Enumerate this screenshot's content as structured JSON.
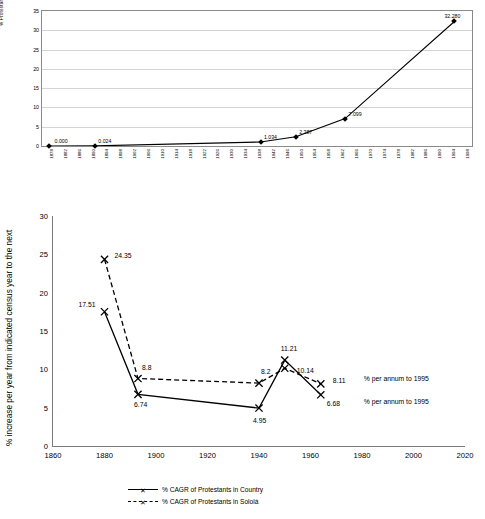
{
  "chart_data": [
    {
      "type": "line",
      "id": "protestant-percentage-by-year",
      "title": "",
      "xlabel": "",
      "ylabel": "% Protestant",
      "ylim": [
        0,
        35
      ],
      "yticks": [
        0,
        5,
        10,
        15,
        20,
        25,
        30,
        35
      ],
      "grid": true,
      "xticks": [
        "1878",
        "1882",
        "1886",
        "1890",
        "1894",
        "1898",
        "1902",
        "1906",
        "1910",
        "1914",
        "1918",
        "1922",
        "1926",
        "1930",
        "1934",
        "1938",
        "1942",
        "1946",
        "1950",
        "1954",
        "1958",
        "1962",
        "1966",
        "1970",
        "1974",
        "1978",
        "1982",
        "1986",
        "1990",
        "1994",
        "1998"
      ],
      "series": [
        {
          "name": "% Protestant",
          "points": [
            {
              "x": "1880",
              "y": 0.0,
              "label": "0.000"
            },
            {
              "x": "1893",
              "y": 0.024,
              "label": "0.024"
            },
            {
              "x": "1940",
              "y": 1.034,
              "label": "1.034"
            },
            {
              "x": "1950",
              "y": 2.387,
              "label": "2.387"
            },
            {
              "x": "1964",
              "y": 7.099,
              "label": "7.099"
            },
            {
              "x": "1995",
              "y": 32.28,
              "label": "32.280"
            }
          ]
        }
      ]
    },
    {
      "type": "line",
      "id": "cagr-protestants",
      "title": "",
      "xlabel": "",
      "ylabel": "% increase per year from indicated census year to the next",
      "ylim": [
        0,
        30
      ],
      "yticks": [
        0,
        5,
        10,
        15,
        20,
        25,
        30
      ],
      "xlim": [
        1860,
        2020
      ],
      "xticks": [
        1860,
        1880,
        1900,
        1920,
        1940,
        1960,
        1980,
        2000,
        2020
      ],
      "grid": false,
      "legend_position": "bottom",
      "series": [
        {
          "name": "% CAGR of Protestants in Country",
          "marker": "x",
          "style": "solid",
          "points": [
            {
              "x": 1880,
              "y": 17.51,
              "label": "17.51"
            },
            {
              "x": 1893,
              "y": 6.74,
              "label": "6.74"
            },
            {
              "x": 1940,
              "y": 4.95,
              "label": "4.95"
            },
            {
              "x": 1950,
              "y": 11.21,
              "label": "11.21"
            },
            {
              "x": 1964,
              "y": 6.68,
              "label": "6.68"
            }
          ]
        },
        {
          "name": "% CAGR of Protestants in Sololá",
          "marker": "x",
          "style": "dashed",
          "points": [
            {
              "x": 1880,
              "y": 24.35,
              "label": "24.35"
            },
            {
              "x": 1893,
              "y": 8.8,
              "label": "8.8"
            },
            {
              "x": 1940,
              "y": 8.2,
              "label": "8.2"
            },
            {
              "x": 1950,
              "y": 10.14,
              "label": "10.14"
            },
            {
              "x": 1964,
              "y": 8.11,
              "label": "8.11"
            }
          ]
        }
      ],
      "annotations": [
        {
          "text": "% per annum to 1995",
          "near": "8.11"
        },
        {
          "text": "% per annum to 1995",
          "near": "6.68"
        }
      ]
    }
  ],
  "legend": {
    "items": [
      {
        "label": "% CAGR of Protestants in Country",
        "style": "solid"
      },
      {
        "label": "% CAGR of Protestants in Sololá",
        "style": "dashed"
      }
    ]
  }
}
